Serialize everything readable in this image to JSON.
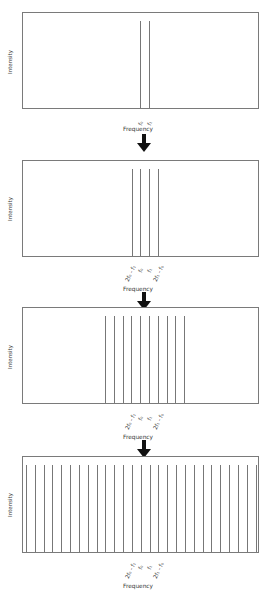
{
  "chart_data": [
    {
      "type": "bar",
      "title": "Panel 1: two seed frequencies",
      "xlabel": "Frequency",
      "ylabel": "Intensity",
      "tick_labels": [
        "f0",
        "f1"
      ],
      "line_positions_px": [
        140,
        149
      ],
      "line_count": 2
    },
    {
      "type": "bar",
      "title": "Panel 2: first-order four-wave mixing sidebands",
      "xlabel": "Frequency",
      "ylabel": "Intensity",
      "tick_labels": [
        "2f0 - f1",
        "f0",
        "f1",
        "2f1 - f0"
      ],
      "line_positions_px": [
        132,
        140,
        149,
        158
      ],
      "line_count": 4
    },
    {
      "type": "bar",
      "title": "Panel 3: cascaded sidebands",
      "xlabel": "Frequency",
      "ylabel": "Intensity",
      "tick_labels": [
        "2f0 - f1",
        "f0",
        "f1",
        "2f1 - f0"
      ],
      "line_count": 10,
      "first_line_px": 105,
      "spacing_px": 8.8
    },
    {
      "type": "bar",
      "title": "Panel 4: broadband frequency comb",
      "xlabel": "Frequency",
      "ylabel": "Intensity",
      "tick_labels": [
        "2f0 - f1",
        "f0",
        "f1",
        "2f1 - f0"
      ],
      "line_count": 27,
      "first_line_px": 26,
      "spacing_px": 8.83
    }
  ],
  "labels": {
    "ylabel": "Intensity",
    "xlabel": "Frequency",
    "f0": "f₀",
    "f1": "f₁",
    "lower": "2f₀ - f₁",
    "upper": "2f₁ - f₀"
  },
  "colors": {
    "line": "#777777",
    "border": "#7a7a7a",
    "arrow": "#111111"
  }
}
